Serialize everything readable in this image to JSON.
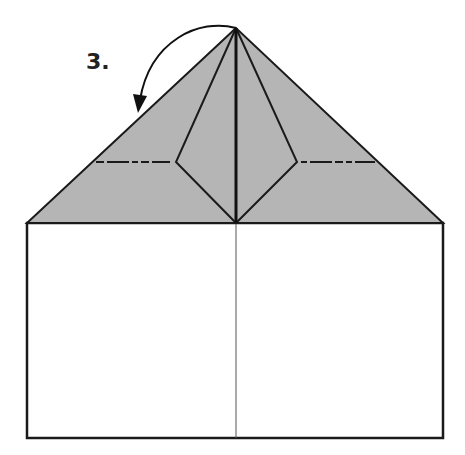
{
  "diagram": {
    "step_label": "3.",
    "colors": {
      "flap_fill": "#b5b5b5",
      "line": "#1a1a1a",
      "paper": "#ffffff"
    }
  }
}
